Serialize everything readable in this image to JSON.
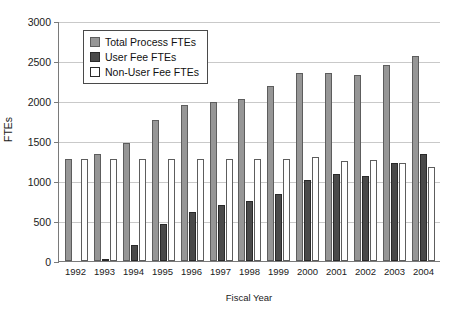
{
  "chart_data": {
    "type": "bar",
    "title": "",
    "xlabel": "Fiscal Year",
    "ylabel": "FTEs",
    "ylim": [
      0,
      3000
    ],
    "ytick_step": 500,
    "yticks": [
      0,
      500,
      1000,
      1500,
      2000,
      2500,
      3000
    ],
    "grid": true,
    "legend_position": "top-left-inside",
    "categories": [
      "1992",
      "1993",
      "1994",
      "1995",
      "1996",
      "1997",
      "1998",
      "1999",
      "2000",
      "2001",
      "2002",
      "2003",
      "2004"
    ],
    "series": [
      {
        "name": "Total Process FTEs",
        "color": "#969696",
        "values": [
          1280,
          1340,
          1480,
          1760,
          1950,
          1990,
          2030,
          2190,
          2350,
          2350,
          2330,
          2450,
          2560
        ]
      },
      {
        "name": "User Fee FTEs",
        "color": "#4a4a4a",
        "values": [
          0,
          30,
          200,
          460,
          610,
          700,
          750,
          840,
          1010,
          1090,
          1060,
          1230,
          1340
        ]
      },
      {
        "name": "Non-User Fee FTEs",
        "color": "#ffffff",
        "values": [
          1280,
          1280,
          1280,
          1280,
          1280,
          1280,
          1280,
          1280,
          1300,
          1250,
          1260,
          1230,
          1180
        ]
      }
    ]
  },
  "axes": {
    "y_title": "FTEs",
    "x_title": "Fiscal Year",
    "y_tick_labels": [
      "3000",
      "2500",
      "2000",
      "1500",
      "1000",
      "500",
      "0"
    ],
    "x_tick_labels": [
      "1992",
      "1993",
      "1994",
      "1995",
      "1996",
      "1997",
      "1998",
      "1999",
      "2000",
      "2001",
      "2002",
      "2003",
      "2004"
    ]
  },
  "legend": {
    "items": [
      {
        "label": "Total Process FTEs",
        "swatch": "total"
      },
      {
        "label": "User Fee FTEs",
        "swatch": "user"
      },
      {
        "label": "Non-User Fee FTEs",
        "swatch": "nonuser"
      }
    ]
  }
}
